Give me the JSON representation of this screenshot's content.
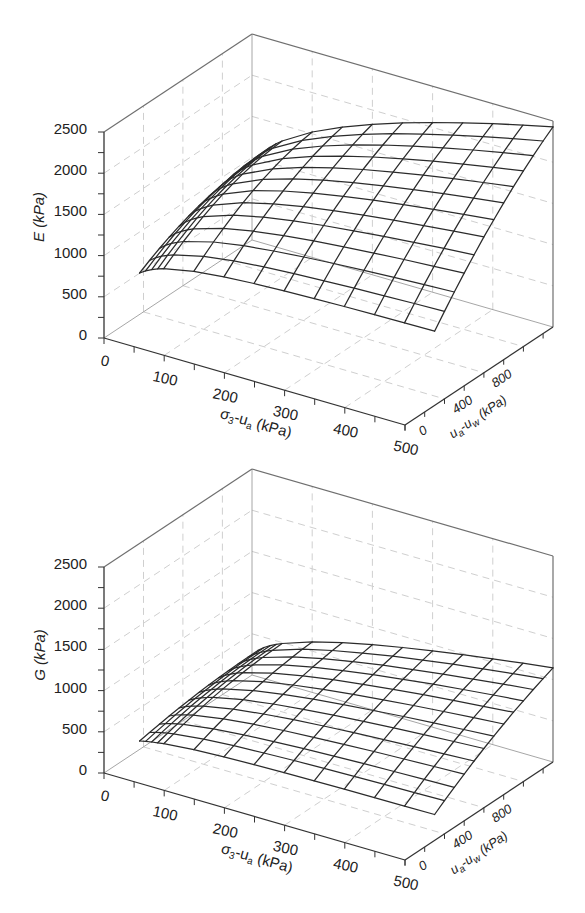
{
  "axis_text": {
    "sigma": {
      "p1": "σ",
      "s1": "3",
      "p2": "-u",
      "s2": "a",
      "p3": " (kPa)"
    },
    "suction": {
      "p1": "u",
      "s1": "a",
      "p2": "-u",
      "s2": "w",
      "p3": " (kPa)"
    }
  },
  "colors": {
    "mesh": "#2b2b2b",
    "axes": "#333333",
    "grid": "#cfcfcf",
    "background": "#ffffff"
  },
  "chart_data": [
    {
      "type": "surface3d",
      "style": "wireframe",
      "title": "",
      "xlabel": "σ3-ua (kPa)",
      "ylabel": "ua-uw (kPa)",
      "zlabel": "E (kPa)",
      "xlim": [
        0,
        500
      ],
      "ylim": [
        0,
        1500
      ],
      "zlim": [
        0,
        2500
      ],
      "xticks": [
        0,
        100,
        200,
        300,
        400,
        500
      ],
      "yticks": [
        0,
        400,
        800
      ],
      "zticks": [
        0,
        500,
        1000,
        1500,
        2000,
        2500
      ],
      "xtick_minor": 50,
      "ytick_minor": 200,
      "ztick_minor": 250,
      "grid": true,
      "xgrid": [
        100,
        200,
        300,
        400
      ],
      "ygrid": [
        400,
        800,
        1200
      ],
      "zgrid": [
        500,
        1000,
        1500,
        2000
      ],
      "x": [
        10,
        20,
        30,
        40,
        50,
        100,
        150,
        200,
        250,
        300,
        350,
        400,
        450,
        500
      ],
      "y": [
        300,
        400,
        500,
        600,
        700,
        800,
        900,
        1000,
        1100,
        1200,
        1300,
        1400,
        1500
      ],
      "z": [
        [
          572,
          644,
          711,
          770,
          823,
          870,
          911,
          945,
          973,
          994,
          1009,
          1018,
          1020
        ],
        [
          619,
          698,
          770,
          835,
          893,
          945,
          989,
          1027,
          1059,
          1083,
          1101,
          1112,
          1116
        ],
        [
          656,
          739,
          815,
          883,
          945,
          1000,
          1048,
          1089,
          1123,
          1150,
          1171,
          1184,
          1190
        ],
        [
          685,
          771,
          850,
          922,
          987,
          1045,
          1096,
          1140,
          1176,
          1206,
          1228,
          1244,
          1252
        ],
        [
          709,
          798,
          880,
          955,
          1023,
          1084,
          1137,
          1183,
          1222,
          1254,
          1279,
          1297,
          1307
        ],
        [
          783,
          885,
          980,
          1067,
          1147,
          1220,
          1285,
          1343,
          1393,
          1437,
          1472,
          1501,
          1522
        ],
        [
          822,
          935,
          1040,
          1137,
          1228,
          1311,
          1387,
          1455,
          1516,
          1570,
          1616,
          1655,
          1687
        ],
        [
          846,
          968,
          1082,
          1189,
          1288,
          1381,
          1466,
          1544,
          1615,
          1679,
          1735,
          1784,
          1826
        ],
        [
          862,
          992,
          1114,
          1230,
          1338,
          1439,
          1534,
          1621,
          1701,
          1773,
          1839,
          1898,
          1949
        ],
        [
          874,
          1011,
          1141,
          1264,
          1380,
          1489,
          1592,
          1687,
          1775,
          1857,
          1931,
          1998,
          2059
        ],
        [
          883,
          1027,
          1164,
          1294,
          1418,
          1534,
          1644,
          1747,
          1844,
          1933,
          2016,
          2092,
          2161
        ],
        [
          890,
          1040,
          1184,
          1321,
          1451,
          1575,
          1692,
          1803,
          1907,
          2004,
          2095,
          2179,
          2256
        ],
        [
          896,
          1052,
          1202,
          1345,
          1482,
          1613,
          1737,
          1854,
          1965,
          2070,
          2168,
          2260,
          2345
        ],
        [
          900,
          1062,
          1218,
          1368,
          1511,
          1648,
          1778,
          1903,
          2021,
          2132,
          2238,
          2336,
          2429
        ]
      ]
    },
    {
      "type": "surface3d",
      "style": "wireframe",
      "title": "",
      "xlabel": "σ3-ua (kPa)",
      "ylabel": "ua-uw (kPa)",
      "zlabel": "G (kPa)",
      "xlim": [
        0,
        500
      ],
      "ylim": [
        0,
        1500
      ],
      "zlim": [
        0,
        2500
      ],
      "xticks": [
        0,
        100,
        200,
        300,
        400,
        500
      ],
      "yticks": [
        0,
        400,
        800
      ],
      "zticks": [
        0,
        500,
        1000,
        1500,
        2000,
        2500
      ],
      "xtick_minor": 50,
      "ytick_minor": 200,
      "ztick_minor": 250,
      "grid": true,
      "xgrid": [
        100,
        200,
        300,
        400
      ],
      "ygrid": [
        400,
        800,
        1200
      ],
      "zgrid": [
        500,
        1000,
        1500,
        2000
      ],
      "x": [
        10,
        20,
        30,
        40,
        50,
        100,
        150,
        200,
        250,
        300,
        350,
        400,
        450,
        500
      ],
      "y": [
        300,
        400,
        500,
        600,
        700,
        800,
        900,
        1000,
        1100,
        1200,
        1300,
        1400,
        1500
      ],
      "z": [
        [
          171,
          195,
          217,
          237,
          255,
          270,
          284,
          295,
          304,
          311,
          316,
          319,
          320
        ],
        [
          188,
          218,
          245,
          270,
          292,
          311,
          328,
          343,
          354,
          364,
          370,
          374,
          376
        ],
        [
          202,
          236,
          267,
          294,
          320,
          342,
          361,
          378,
          392,
          403,
          411,
          416,
          419
        ],
        [
          213,
          250,
          284,
          315,
          343,
          367,
          389,
          408,
          424,
          436,
          446,
          452,
          456
        ],
        [
          223,
          263,
          299,
          332,
          362,
          389,
          413,
          433,
          451,
          465,
          476,
          483,
          488
        ],
        [
          256,
          305,
          351,
          393,
          432,
          467,
          498,
          526,
          551,
          572,
          589,
          603,
          613
        ],
        [
          274,
          331,
          383,
          433,
          478,
          520,
          558,
          592,
          623,
          650,
          673,
          693,
          709
        ],
        [
          286,
          348,
          407,
          462,
          514,
          561,
          605,
          645,
          682,
          714,
          743,
          768,
          790
        ],
        [
          294,
          362,
          426,
          486,
          543,
          596,
          645,
          690,
          732,
          770,
          805,
          835,
          862
        ],
        [
          300,
          372,
          441,
          506,
          567,
          625,
          679,
          729,
          776,
          819,
          858,
          894,
          926
        ],
        [
          305,
          382,
          455,
          524,
          590,
          652,
          711,
          765,
          817,
          865,
          909,
          949,
          986
        ],
        [
          308,
          389,
          466,
          539,
          609,
          676,
          739,
          798,
          854,
          906,
          954,
          999,
          1041
        ],
        [
          311,
          395,
          476,
          554,
          628,
          698,
          765,
          828,
          888,
          945,
          998,
          1047,
          1093
        ],
        [
          314,
          402,
          486,
          567,
          647,
          719,
          790,
          857,
          921,
          981,
          1038,
          1091,
          1142
        ]
      ]
    }
  ]
}
